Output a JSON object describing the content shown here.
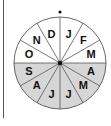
{
  "diagram": {
    "center": [
      60,
      63
    ],
    "radius": 46,
    "colors": {
      "upper_half": "#ffffff",
      "lower_half": "#d6d6d6",
      "lines": "#555555"
    },
    "segments": [
      {
        "label": "J",
        "half": "upper"
      },
      {
        "label": "F",
        "half": "upper"
      },
      {
        "label": "M",
        "half": "upper"
      },
      {
        "label": "A",
        "half": "lower"
      },
      {
        "label": "M",
        "half": "lower"
      },
      {
        "label": "J",
        "half": "lower"
      },
      {
        "label": "J",
        "half": "lower"
      },
      {
        "label": "A",
        "half": "lower"
      },
      {
        "label": "S",
        "half": "lower"
      },
      {
        "label": "O",
        "half": "upper"
      },
      {
        "label": "N",
        "half": "upper"
      },
      {
        "label": "D",
        "half": "upper"
      }
    ],
    "top_marker": "dot"
  }
}
